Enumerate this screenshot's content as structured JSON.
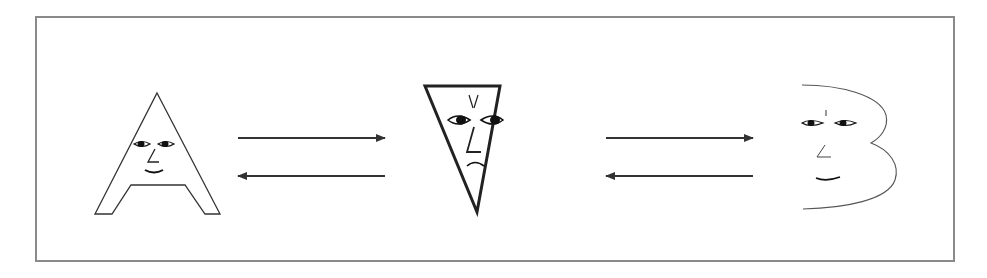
{
  "diagram": {
    "type": "letter-transformation",
    "colors": {
      "frame": "#8a8a8a",
      "stroke": "#222222",
      "arrow": "#333333",
      "background": "#ffffff"
    },
    "nodes": [
      {
        "id": "letter-a",
        "label": "A",
        "expression": "smiling",
        "shape": "letter-A outline"
      },
      {
        "id": "inverted-triangle",
        "label": "",
        "expression": "frowning",
        "shape": "inverted triangle (thick outline)"
      },
      {
        "id": "letter-b",
        "label": "B",
        "expression": "smiling",
        "shape": "letter-B curve (open left side)"
      }
    ],
    "edges": [
      {
        "from": "letter-a",
        "to": "inverted-triangle",
        "direction": "forward"
      },
      {
        "from": "inverted-triangle",
        "to": "letter-a",
        "direction": "backward"
      },
      {
        "from": "inverted-triangle",
        "to": "letter-b",
        "direction": "forward"
      },
      {
        "from": "letter-b",
        "to": "inverted-triangle",
        "direction": "backward"
      }
    ]
  }
}
